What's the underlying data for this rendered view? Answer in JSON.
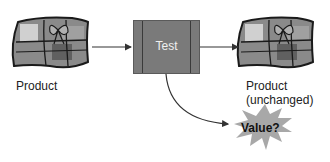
{
  "diagram": {
    "nodes": {
      "input": {
        "label": "Product",
        "icon": "gift-box-icon"
      },
      "process": {
        "label": "Test"
      },
      "output": {
        "label_line1": "Product",
        "label_line2": "(unchanged)",
        "icon": "gift-box-icon"
      },
      "result": {
        "label": "Value?",
        "shape": "starburst"
      }
    },
    "edges": [
      {
        "from": "input",
        "to": "process"
      },
      {
        "from": "process",
        "to": "output"
      },
      {
        "from": "process",
        "to": "result",
        "style": "curved"
      }
    ],
    "colors": {
      "box_fill": "#7a7a7a",
      "starburst_fill": "#a8a8a8",
      "gift_dark": "#6e6e6e",
      "gift_light": "#c8c8c8",
      "stroke": "#222222"
    }
  }
}
